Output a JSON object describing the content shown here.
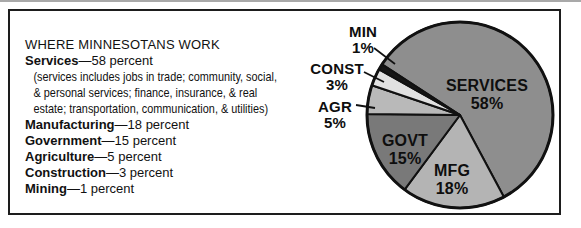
{
  "legend": {
    "title": "WHERE MINNESOTANS WORK",
    "entries": [
      {
        "term": "Services",
        "detail": "—58 percent",
        "note_lines": [
          "(services includes jobs in trade; community, social,",
          "& personal services; finance, insurance, & real",
          "estate; transportation, communication, & utilities)"
        ]
      },
      {
        "term": "Manufacturing",
        "detail": "—18 percent"
      },
      {
        "term": "Government",
        "detail": "—15 percent"
      },
      {
        "term": "Agriculture",
        "detail": "—5 percent"
      },
      {
        "term": "Construction",
        "detail": "—3 percent"
      },
      {
        "term": "Mining",
        "detail": "—1 percent"
      }
    ]
  },
  "chart_data": {
    "type": "pie",
    "title": "WHERE MINNESOTANS WORK",
    "direction": "clockwise",
    "start_angle_deg": 147,
    "legend_position": "left-panel",
    "outline_color": "#111111",
    "slices": [
      {
        "label": "Services",
        "abbr": "SERVICES",
        "value_pct": 58,
        "pct_label": "58%",
        "color": "#8e8e8e",
        "label_placement": "inside"
      },
      {
        "label": "Manufacturing",
        "abbr": "MFG",
        "value_pct": 18,
        "pct_label": "18%",
        "color": "#b4b4b4",
        "label_placement": "inside"
      },
      {
        "label": "Government",
        "abbr": "GOVT",
        "value_pct": 15,
        "pct_label": "15%",
        "color": "#797979",
        "label_placement": "inside"
      },
      {
        "label": "Agriculture",
        "abbr": "AGR",
        "value_pct": 5,
        "pct_label": "5%",
        "color": "#b9b9b9",
        "label_placement": "outside"
      },
      {
        "label": "Construction",
        "abbr": "CONST",
        "value_pct": 3,
        "pct_label": "3%",
        "color": "#e1e1e1",
        "label_placement": "outside"
      },
      {
        "label": "Mining",
        "abbr": "MIN",
        "value_pct": 1,
        "pct_label": "1%",
        "color": "#161616",
        "label_placement": "outside"
      }
    ]
  }
}
